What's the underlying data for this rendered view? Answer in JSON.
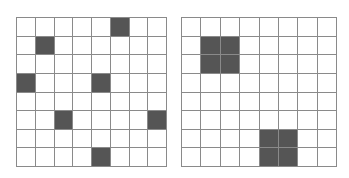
{
  "grids": [
    {
      "name": "left-grid",
      "rows": 8,
      "cols": 8,
      "filled_color": "#555555",
      "filled_cells": [
        [
          0,
          5
        ],
        [
          1,
          1
        ],
        [
          3,
          0
        ],
        [
          3,
          4
        ],
        [
          5,
          2
        ],
        [
          5,
          7
        ],
        [
          7,
          4
        ]
      ]
    },
    {
      "name": "right-grid",
      "rows": 8,
      "cols": 8,
      "filled_color": "#555555",
      "filled_cells": [
        [
          1,
          1
        ],
        [
          1,
          2
        ],
        [
          2,
          1
        ],
        [
          2,
          2
        ],
        [
          6,
          4
        ],
        [
          6,
          5
        ],
        [
          7,
          4
        ],
        [
          7,
          5
        ]
      ]
    }
  ]
}
